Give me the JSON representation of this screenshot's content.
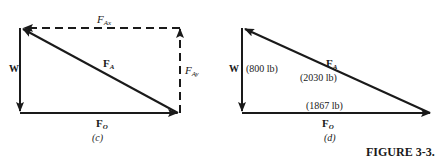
{
  "figure_caption": "FIGURE 3-3.",
  "panels": [
    {
      "id": "c",
      "caption": "(c)",
      "labels": {
        "W": "W",
        "FA": "F",
        "FA_sub": "A",
        "FO": "F",
        "FO_sub": "O",
        "FAx": "F",
        "FAx_sub": "Ax",
        "FAy": "F",
        "FAy_sub": "Ay"
      },
      "vectors": [
        {
          "name": "W",
          "style": "solid",
          "direction": "down"
        },
        {
          "name": "F_O",
          "style": "solid",
          "direction": "right"
        },
        {
          "name": "F_A",
          "style": "solid",
          "direction": "up-left"
        },
        {
          "name": "F_Ax",
          "style": "dashed",
          "direction": "left"
        },
        {
          "name": "F_Ay",
          "style": "dashed",
          "direction": "up"
        }
      ]
    },
    {
      "id": "d",
      "caption": "(d)",
      "labels": {
        "W": "W",
        "W_value": "(800 lb)",
        "FA": "F",
        "FA_sub": "A",
        "FA_value": "(2030 lb)",
        "FO": "F",
        "FO_sub": "O",
        "FO_value": "(1867 lb)"
      },
      "vectors": [
        {
          "name": "W",
          "magnitude": "800 lb",
          "style": "solid",
          "direction": "down"
        },
        {
          "name": "F_O",
          "magnitude": "1867 lb",
          "style": "solid",
          "direction": "right"
        },
        {
          "name": "F_A",
          "magnitude": "2030 lb",
          "style": "solid",
          "direction": "up-left"
        }
      ]
    }
  ]
}
